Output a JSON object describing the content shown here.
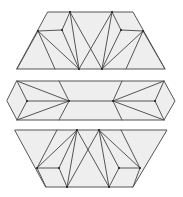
{
  "diagram": {
    "colors": {
      "fill": "#eeeeee",
      "stroke": "#555555",
      "background": "#ffffff"
    },
    "shapes": [
      {
        "name": "top-trapezoid",
        "outline": [
          [
            48,
            12
          ],
          [
            133,
            12
          ],
          [
            165,
            69
          ],
          [
            17,
            69
          ]
        ],
        "vertices": [
          [
            70,
            12
          ],
          [
            112,
            12
          ],
          [
            38,
            31
          ],
          [
            62,
            30
          ],
          [
            121,
            30
          ],
          [
            143,
            31
          ],
          [
            79,
            69
          ],
          [
            102,
            69
          ]
        ],
        "edges": [
          [
            [
              38,
              31
            ],
            [
              62,
              30
            ]
          ],
          [
            [
              62,
              30
            ],
            [
              70,
              12
            ]
          ],
          [
            [
              62,
              30
            ],
            [
              79,
              69
            ]
          ],
          [
            [
              38,
              31
            ],
            [
              79,
              69
            ]
          ],
          [
            [
              38,
              31
            ],
            [
              55,
              69
            ]
          ],
          [
            [
              70,
              12
            ],
            [
              79,
              69
            ]
          ],
          [
            [
              70,
              12
            ],
            [
              102,
              69
            ]
          ],
          [
            [
              112,
              12
            ],
            [
              79,
              69
            ]
          ],
          [
            [
              112,
              12
            ],
            [
              102,
              69
            ]
          ],
          [
            [
              112,
              12
            ],
            [
              121,
              30
            ]
          ],
          [
            [
              121,
              30
            ],
            [
              143,
              31
            ]
          ],
          [
            [
              121,
              30
            ],
            [
              102,
              69
            ]
          ],
          [
            [
              143,
              31
            ],
            [
              102,
              69
            ]
          ],
          [
            [
              143,
              31
            ],
            [
              126,
              69
            ]
          ],
          [
            [
              38,
              31
            ],
            [
              17,
              69
            ]
          ],
          [
            [
              143,
              31
            ],
            [
              165,
              69
            ]
          ]
        ]
      },
      {
        "name": "middle-hexagon",
        "outline": [
          [
            17,
            81
          ],
          [
            164,
            81
          ],
          [
            175,
            101
          ],
          [
            164,
            120
          ],
          [
            17,
            120
          ],
          [
            7,
            101
          ]
        ],
        "vertices": [
          [
            27,
            101
          ],
          [
            69,
            101
          ],
          [
            113,
            101
          ],
          [
            155,
            101
          ]
        ],
        "edges": [
          [
            [
              17,
              81
            ],
            [
              27,
              101
            ]
          ],
          [
            [
              27,
              101
            ],
            [
              17,
              120
            ]
          ],
          [
            [
              27,
              101
            ],
            [
              69,
              101
            ]
          ],
          [
            [
              17,
              81
            ],
            [
              69,
              101
            ]
          ],
          [
            [
              17,
              120
            ],
            [
              69,
              101
            ]
          ],
          [
            [
              59,
              81
            ],
            [
              69,
              101
            ]
          ],
          [
            [
              59,
              120
            ],
            [
              69,
              101
            ]
          ],
          [
            [
              69,
              101
            ],
            [
              113,
              101
            ]
          ],
          [
            [
              164,
              81
            ],
            [
              155,
              101
            ]
          ],
          [
            [
              155,
              101
            ],
            [
              164,
              120
            ]
          ],
          [
            [
              155,
              101
            ],
            [
              113,
              101
            ]
          ],
          [
            [
              164,
              81
            ],
            [
              113,
              101
            ]
          ],
          [
            [
              164,
              120
            ],
            [
              113,
              101
            ]
          ],
          [
            [
              122,
              81
            ],
            [
              113,
              101
            ]
          ],
          [
            [
              122,
              120
            ],
            [
              113,
              101
            ]
          ]
        ]
      },
      {
        "name": "bottom-trapezoid",
        "outline": [
          [
            15,
            130
          ],
          [
            167,
            130
          ],
          [
            133,
            187
          ],
          [
            46,
            187
          ]
        ],
        "vertices": [
          [
            77,
            130
          ],
          [
            99,
            130
          ],
          [
            37,
            168
          ],
          [
            59,
            168
          ],
          [
            119,
            168
          ],
          [
            140,
            168
          ],
          [
            67,
            187
          ],
          [
            109,
            187
          ]
        ],
        "edges": [
          [
            [
              57,
              130
            ],
            [
              37,
              168
            ]
          ],
          [
            [
              37,
              168
            ],
            [
              77,
              130
            ]
          ],
          [
            [
              37,
              168
            ],
            [
              59,
              168
            ]
          ],
          [
            [
              59,
              168
            ],
            [
              77,
              130
            ]
          ],
          [
            [
              59,
              168
            ],
            [
              67,
              187
            ]
          ],
          [
            [
              77,
              130
            ],
            [
              67,
              187
            ]
          ],
          [
            [
              77,
              130
            ],
            [
              109,
              187
            ]
          ],
          [
            [
              99,
              130
            ],
            [
              67,
              187
            ]
          ],
          [
            [
              99,
              130
            ],
            [
              109,
              187
            ]
          ],
          [
            [
              99,
              130
            ],
            [
              119,
              168
            ]
          ],
          [
            [
              119,
              168
            ],
            [
              109,
              187
            ]
          ],
          [
            [
              119,
              168
            ],
            [
              140,
              168
            ]
          ],
          [
            [
              140,
              168
            ],
            [
              99,
              130
            ]
          ],
          [
            [
              140,
              168
            ],
            [
              121,
              130
            ]
          ],
          [
            [
              37,
              168
            ],
            [
              46,
              187
            ]
          ],
          [
            [
              140,
              168
            ],
            [
              133,
              187
            ]
          ]
        ]
      }
    ]
  }
}
